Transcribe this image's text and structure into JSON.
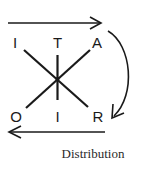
{
  "diagram": {
    "labels": {
      "top_left": "I",
      "top_center": "T",
      "top_right": "A",
      "bottom_left": "O",
      "bottom_center": "I",
      "bottom_right": "R"
    },
    "caption": "Distribution",
    "colors": {
      "stroke": "#1a1a1a",
      "background": "#ffffff"
    },
    "arrows": [
      {
        "name": "top-arrow",
        "direction": "right"
      },
      {
        "name": "curved-arrow",
        "direction": "clockwise-down"
      },
      {
        "name": "bottom-arrow",
        "direction": "left"
      }
    ]
  }
}
